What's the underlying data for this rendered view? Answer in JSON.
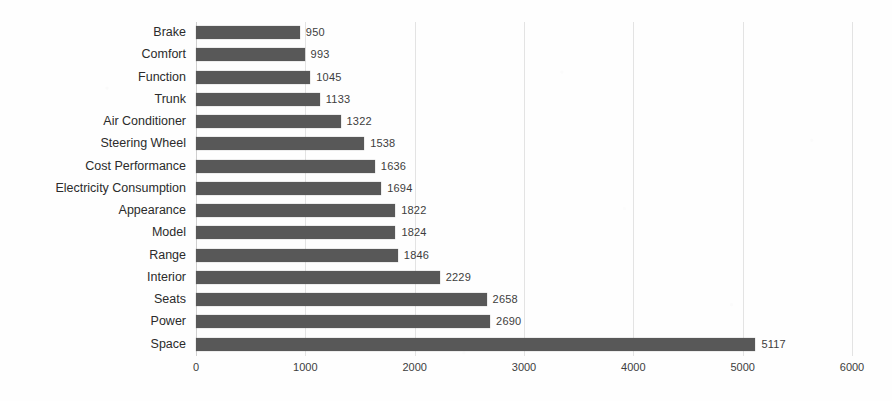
{
  "chart_data": {
    "type": "bar",
    "orientation": "horizontal",
    "title": "",
    "subtitle": "",
    "xlabel": "",
    "ylabel": "",
    "xlim": [
      0,
      6000
    ],
    "xticks": [
      0,
      1000,
      2000,
      3000,
      4000,
      5000,
      6000
    ],
    "xtick_labels": [
      "0",
      "1000",
      "2000",
      "3000",
      "4000",
      "5000",
      "6000"
    ],
    "grid": true,
    "grid_axis": "x",
    "legend": false,
    "legend_position": "none",
    "data_labels": true,
    "bar_color": "#585858",
    "background_color": "#ffffff",
    "categories": [
      "Brake",
      "Comfort",
      "Function",
      "Trunk",
      "Air Conditioner",
      "Steering Wheel",
      "Cost Performance",
      "Electricity Consumption",
      "Appearance",
      "Model",
      "Range",
      "Interior",
      "Seats",
      "Power",
      "Space"
    ],
    "values": [
      950,
      993,
      1045,
      1133,
      1322,
      1538,
      1636,
      1694,
      1822,
      1824,
      1846,
      2229,
      2658,
      2690,
      5117
    ],
    "value_labels": [
      "950",
      "993",
      "1045",
      "1133",
      "1322",
      "1538",
      "1636",
      "1694",
      "1822",
      "1824",
      "1846",
      "2229",
      "2658",
      "2690",
      "5117"
    ]
  }
}
